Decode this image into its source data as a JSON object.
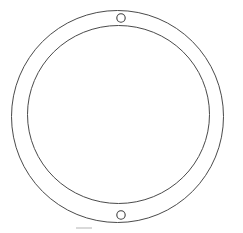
{
  "canvas": {
    "width": 243,
    "height": 233,
    "background_color": "#ffffff",
    "title": "Ring Gasket Outline Drawing"
  },
  "style": {
    "line_color": "#4a4a4a",
    "hole_line_color": "#3d3d3d",
    "faint_mark_color": "#c9c9c9",
    "line_width": 1,
    "hole_line_width": 1.1
  },
  "drawing": {
    "type": "annular-ring",
    "outer_ring": {
      "label": "outer-circle",
      "center_x": 117.5,
      "center_y": 116.5,
      "radius_x": 106,
      "radius_y": 106
    },
    "inner_ring": {
      "label": "inner-circle",
      "center_x": 118.5,
      "center_y": 114.5,
      "radius_x": 91,
      "radius_y": 89
    },
    "holes": [
      {
        "label": "top-mounting-hole",
        "center_x": 121,
        "center_y": 18,
        "radius": 4.2
      },
      {
        "label": "bottom-mounting-hole",
        "center_x": 121,
        "center_y": 215,
        "radius": 4.2
      }
    ],
    "faint_marks": [
      {
        "label": "bottom-faint-segment",
        "x1": 76,
        "y1": 228,
        "x2": 92,
        "y2": 228
      }
    ]
  }
}
